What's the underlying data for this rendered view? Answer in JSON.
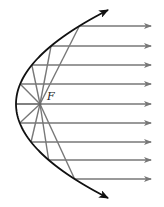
{
  "diagram": {
    "focus_label": "F",
    "focus": {
      "x": 40,
      "y": 104
    },
    "vertex": {
      "x": 16,
      "y": 104
    },
    "ray_y": [
      26,
      46,
      65,
      84,
      104,
      123,
      142,
      160,
      179
    ],
    "ray_end_x": 151,
    "colors": {
      "curve": "#111111",
      "ray": "#777777",
      "background": "#ffffff"
    }
  }
}
